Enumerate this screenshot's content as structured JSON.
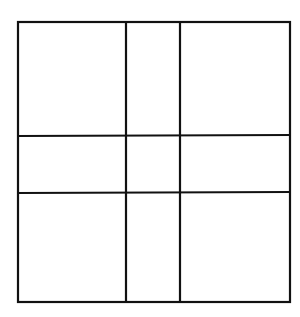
{
  "diagram": {
    "type": "grid",
    "stroke_color": "#111111",
    "background_color": "#ffffff",
    "outer_box": {
      "x1": 18,
      "y1": 22,
      "x2": 290,
      "y2": 302
    },
    "vertical_lines_x": [
      126,
      180
    ],
    "horizontal_lines_y": [
      136,
      193
    ],
    "rows": 3,
    "columns": 3
  }
}
